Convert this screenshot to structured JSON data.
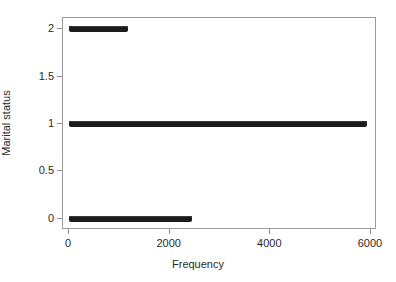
{
  "chart_data": {
    "type": "scatter",
    "title": "",
    "xlabel": "Frequency",
    "ylabel": "Marital status",
    "xlim": [
      -120,
      6120
    ],
    "ylim": [
      -0.12,
      2.12
    ],
    "grid": false,
    "legend": null,
    "xticks": [
      0,
      2000,
      4000,
      6000
    ],
    "xticklabels": [
      "0",
      "2000",
      "4000",
      "6000"
    ],
    "yticks": [
      0,
      0.5,
      1,
      1.5,
      2
    ],
    "yticklabels": [
      "0",
      "0.5",
      "1",
      "1.5",
      "2"
    ],
    "series": [
      {
        "name": "Marital status = 0",
        "y": 0,
        "x_start": 0,
        "x_end": 2440,
        "count_label": "",
        "color": "#1b1b1b"
      },
      {
        "name": "Marital status = 1",
        "y": 1,
        "x_start": 0,
        "x_end": 5930,
        "count_label": "",
        "color": "#1b1b1b"
      },
      {
        "name": "Marital status = 2",
        "y": 2,
        "x_start": 0,
        "x_end": 1165,
        "count_label": "",
        "color": "#1b1b1b"
      }
    ],
    "colors": {
      "marker": "#1b1b1b",
      "frame": "#9a9a9a",
      "background": "#ffffff",
      "text": "#2a2a2a"
    }
  }
}
